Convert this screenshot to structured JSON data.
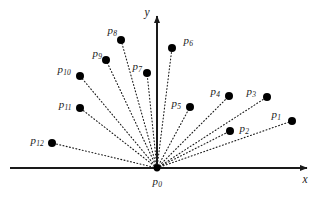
{
  "figure": {
    "width": 320,
    "height": 199,
    "background_color": "#ffffff",
    "line_color": "#1a1a1a",
    "axis_color": "#1a1a1a",
    "point_color": "#000000",
    "point_radius": 4.0
  },
  "axes": {
    "origin": {
      "x": 157,
      "y": 168
    },
    "x_axis": {
      "label": "x",
      "x1": 10,
      "y1": 168,
      "x2": 307,
      "y2": 168,
      "label_x": 305,
      "label_y": 180,
      "arrow": "right"
    },
    "y_axis": {
      "label": "y",
      "x1": 157,
      "y1": 168,
      "x2": 157,
      "y2": 16,
      "label_x": 147,
      "label_y": 13,
      "arrow": "up"
    }
  },
  "origin_point": {
    "id": "p0",
    "base": "p",
    "sub": "0",
    "x": 157,
    "y": 168,
    "label_x": 157,
    "label_y": 181
  },
  "points": [
    {
      "id": "p1",
      "base": "p",
      "sub": "1",
      "x": 292,
      "y": 121,
      "label_x": 276,
      "label_y": 114
    },
    {
      "id": "p2",
      "base": "p",
      "sub": "2",
      "x": 230,
      "y": 131,
      "label_x": 244,
      "label_y": 128
    },
    {
      "id": "p3",
      "base": "p",
      "sub": "3",
      "x": 267,
      "y": 97,
      "label_x": 251,
      "label_y": 91
    },
    {
      "id": "p4",
      "base": "p",
      "sub": "4",
      "x": 229,
      "y": 96,
      "label_x": 215,
      "label_y": 91
    },
    {
      "id": "p5",
      "base": "p",
      "sub": "5",
      "x": 190,
      "y": 107,
      "label_x": 176,
      "label_y": 103
    },
    {
      "id": "p6",
      "base": "p",
      "sub": "6",
      "x": 172,
      "y": 48,
      "label_x": 188,
      "label_y": 40
    },
    {
      "id": "p7",
      "base": "p",
      "sub": "7",
      "x": 147,
      "y": 73,
      "label_x": 137,
      "label_y": 66
    },
    {
      "id": "p8",
      "base": "p",
      "sub": "8",
      "x": 121,
      "y": 40,
      "label_x": 112,
      "label_y": 30
    },
    {
      "id": "p9",
      "base": "p",
      "sub": "9",
      "x": 106,
      "y": 60,
      "label_x": 97,
      "label_y": 53
    },
    {
      "id": "p10",
      "base": "p",
      "sub": "10",
      "x": 80,
      "y": 76,
      "label_x": 64,
      "label_y": 69
    },
    {
      "id": "p11",
      "base": "p",
      "sub": "11",
      "x": 80,
      "y": 108,
      "label_x": 65,
      "label_y": 104
    },
    {
      "id": "p12",
      "base": "p",
      "sub": "12",
      "x": 52,
      "y": 143,
      "label_x": 37,
      "label_y": 140
    }
  ]
}
